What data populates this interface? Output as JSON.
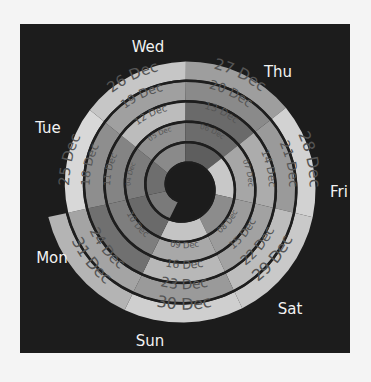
{
  "chart_data": {
    "type": "spiral-calendar",
    "title": "",
    "center": [
      185,
      187
    ],
    "weekdays": [
      "Wed",
      "Thu",
      "Fri",
      "Sat",
      "Sun",
      "Mon",
      "Tue"
    ],
    "first_sector_start_deg": -141,
    "ring_pitch_px": 20.5,
    "ring_thickness_px": 18,
    "outer_radius_last_px": 140,
    "days": [
      {
        "date": "26 Nov",
        "day": "Mon",
        "shade": "#7a7a7a",
        "label": ""
      },
      {
        "date": "27 Nov",
        "day": "Tue",
        "shade": "#6e6e6e",
        "label": ""
      },
      {
        "date": "28 Nov",
        "day": "Wed",
        "shade": "#8a8a8a",
        "label": ""
      },
      {
        "date": "29 Nov",
        "day": "Thu",
        "shade": "#5e5e5e",
        "label": ""
      },
      {
        "date": "30 Nov",
        "day": "Fri",
        "shade": "#c8c8c8",
        "label": ""
      },
      {
        "date": "01 Dec",
        "day": "Sat",
        "shade": "#8c8c8c",
        "label": ""
      },
      {
        "date": "02 Dec",
        "day": "Sun",
        "shade": "#c4c4c4",
        "label": ""
      },
      {
        "date": "03 Dec",
        "day": "Mon",
        "shade": "#6a6a6a",
        "label": ""
      },
      {
        "date": "04 Dec",
        "day": "Tue",
        "shade": "#7c7c7c",
        "label": "04 Dec"
      },
      {
        "date": "05 Dec",
        "day": "Wed",
        "shade": "#909090",
        "label": "05 Dec"
      },
      {
        "date": "06 Dec",
        "day": "Thu",
        "shade": "#6c6c6c",
        "label": "06 Dec"
      },
      {
        "date": "07 Dec",
        "day": "Fri",
        "shade": "#a6a6a6",
        "label": "07 Dec"
      },
      {
        "date": "08 Dec",
        "day": "Sat",
        "shade": "#9c9c9c",
        "label": "08 Dec"
      },
      {
        "date": "09 Dec",
        "day": "Sun",
        "shade": "#a8a8a8",
        "label": "09 Dec"
      },
      {
        "date": "10 Dec",
        "day": "Mon",
        "shade": "#7e7e7e",
        "label": "10 Dec"
      },
      {
        "date": "11 Dec",
        "day": "Tue",
        "shade": "#848484",
        "label": "11 Dec"
      },
      {
        "date": "12 Dec",
        "day": "Wed",
        "shade": "#bcbcbc",
        "label": "12 Dec"
      },
      {
        "date": "13 Dec",
        "day": "Thu",
        "shade": "#6a6a6a",
        "label": "13 Dec"
      },
      {
        "date": "14 Dec",
        "day": "Fri",
        "shade": "#acacac",
        "label": "14 Dec"
      },
      {
        "date": "15 Dec",
        "day": "Sat",
        "shade": "#a2a2a2",
        "label": "15 Dec"
      },
      {
        "date": "16 Dec",
        "day": "Sun",
        "shade": "#b8b8b8",
        "label": "16 Dec"
      },
      {
        "date": "17 Dec",
        "day": "Mon",
        "shade": "#707070",
        "label": ""
      },
      {
        "date": "18 Dec",
        "day": "Tue",
        "shade": "#8e8e8e",
        "label": "18 Dec"
      },
      {
        "date": "19 Dec",
        "day": "Wed",
        "shade": "#a0a0a0",
        "label": "19 Dec"
      },
      {
        "date": "20 Dec",
        "day": "Thu",
        "shade": "#8a8a8a",
        "label": "20 Dec"
      },
      {
        "date": "21 Dec",
        "day": "Fri",
        "shade": "#9a9a9a",
        "label": "21 Dec"
      },
      {
        "date": "22 Dec",
        "day": "Sat",
        "shade": "#bdbdbd",
        "label": "22 Dec"
      },
      {
        "date": "23 Dec",
        "day": "Sun",
        "shade": "#9a9a9a",
        "label": "23 Dec"
      },
      {
        "date": "24 Dec",
        "day": "Mon",
        "shade": "#a4a4a4",
        "label": "24 Dec"
      },
      {
        "date": "25 Dec",
        "day": "Tue",
        "shade": "#d8d8d8",
        "label": "25 Dec"
      },
      {
        "date": "26 Dec",
        "day": "Wed",
        "shade": "#c6c6c6",
        "label": "26 Dec"
      },
      {
        "date": "27 Dec",
        "day": "Thu",
        "shade": "#9e9e9e",
        "label": "27 Dec"
      },
      {
        "date": "28 Dec",
        "day": "Fri",
        "shade": "#d2d2d2",
        "label": "28 Dec"
      },
      {
        "date": "29 Dec",
        "day": "Sat",
        "shade": "#c9c9c9",
        "label": "29 Dec"
      },
      {
        "date": "30 Dec",
        "day": "Sun",
        "shade": "#cfcfcf",
        "label": "30 Dec"
      },
      {
        "date": "31 Dec",
        "day": "Mon",
        "shade": "#b4b4b4",
        "label": "31 Dec"
      }
    ],
    "day_label_positions": {
      "Wed": [
        148,
        52
      ],
      "Thu": [
        278,
        77
      ],
      "Fri": [
        339,
        197
      ],
      "Sat": [
        290,
        314
      ],
      "Sun": [
        150,
        346
      ],
      "Mon": [
        52,
        263
      ],
      "Tue": [
        48,
        133
      ]
    },
    "legend": "none",
    "grid": false
  }
}
